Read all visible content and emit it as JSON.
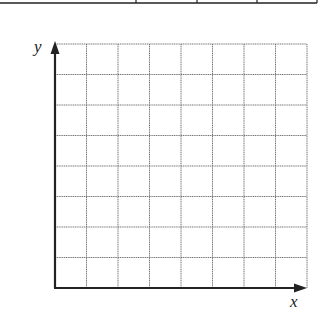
{
  "top_table": {
    "bottom_y": 3,
    "right_x": 317,
    "dividers_x": [
      136,
      197,
      257
    ],
    "stroke": "#222222"
  },
  "graph": {
    "x_axis_label": "x",
    "y_axis_label": "y",
    "columns": 8,
    "rows": 8,
    "origin": {
      "x": 55,
      "y": 288
    },
    "right_x": 307,
    "top_y": 44,
    "axis_color": "#222222",
    "grid_color": "#777777"
  }
}
